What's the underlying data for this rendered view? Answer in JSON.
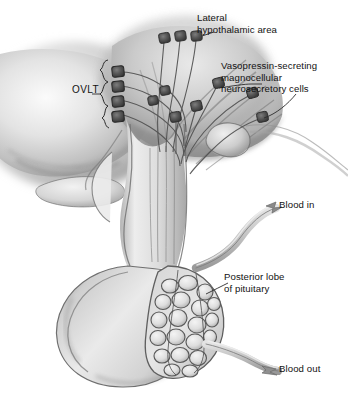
{
  "figure": {
    "style": "grayscale medical line-and-tone illustration, midsagittal section",
    "background_color": "#ffffff"
  },
  "labels": {
    "lateral_hypothalamic_area": {
      "line1": "Lateral",
      "line2": "hypothalamic area"
    },
    "magnocellular_cells": {
      "line1": "Vasopressin-secreting",
      "line2": "magnocellular",
      "line3": "neurosecretory cells"
    },
    "ovlt": {
      "text": "OVLT"
    },
    "blood_in": {
      "text": "Blood in"
    },
    "posterior_lobe": {
      "line1": "Posterior lobe",
      "line2": "of pituitary"
    },
    "blood_out": {
      "text": "Blood out"
    }
  },
  "structures": [
    {
      "name": "brain-tissue-mass",
      "region": "upper-left",
      "shading": "soft gray gradient"
    },
    {
      "name": "hypothalamus",
      "region": "upper-center",
      "shading": "stippled gray"
    },
    {
      "name": "third-ventricle-wall",
      "region": "center-left"
    },
    {
      "name": "optic-chiasm",
      "region": "left-center",
      "shading": "light gray lobe"
    },
    {
      "name": "mammillary-body",
      "region": "right-center",
      "shading": "rounded pale lobe"
    },
    {
      "name": "infundibular-stalk",
      "region": "center",
      "detail": "axon tracts descending"
    },
    {
      "name": "anterior-lobe-of-pituitary",
      "region": "lower-left",
      "shading": "large smooth pale mass"
    },
    {
      "name": "posterior-lobe-of-pituitary",
      "region": "lower-right",
      "detail": "capillary plexus network"
    },
    {
      "name": "neurosecretory-cell-bodies",
      "count": 10,
      "shading": "dark gray squares"
    },
    {
      "name": "ovlt-cell-column",
      "count": 4,
      "region": "left of stalk"
    },
    {
      "name": "inflow-artery",
      "label": "Blood in"
    },
    {
      "name": "outflow-vein",
      "label": "Blood out"
    }
  ],
  "colors": {
    "ink": "#121212",
    "leader_line": "#3a3a3a",
    "tissue_light": "#e9e9e9",
    "tissue_mid": "#bdbdbd",
    "tissue_dark": "#8a8a8a",
    "tissue_deep": "#5f5f5f",
    "vessel": "#b9b9b9",
    "cell_body": "#4a4a4a",
    "background": "#ffffff"
  }
}
